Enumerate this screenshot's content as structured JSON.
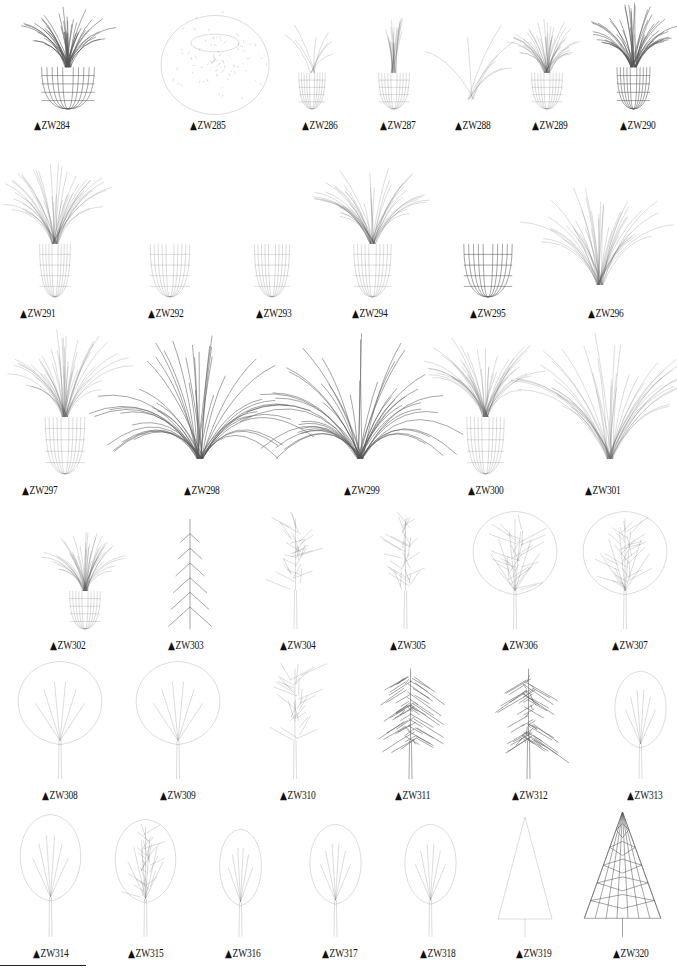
{
  "page": {
    "background": "#ffffff",
    "line_color": "#555555",
    "marker_glyph": "▲"
  },
  "rows": [
    {
      "label_y": 127,
      "items": [
        {
          "code": "ZW284",
          "cx": 68,
          "lx": 34,
          "type": "grass-pot",
          "w": 120,
          "h": 110,
          "dark": true
        },
        {
          "code": "ZW285",
          "cx": 215,
          "lx": 190,
          "type": "round-bush",
          "w": 120,
          "h": 110,
          "dark": false
        },
        {
          "code": "ZW286",
          "cx": 312,
          "lx": 302,
          "type": "leaf-pot",
          "w": 60,
          "h": 95,
          "dark": false
        },
        {
          "code": "ZW287",
          "cx": 394,
          "lx": 380,
          "type": "column-pot",
          "w": 70,
          "h": 95,
          "dark": false
        },
        {
          "code": "ZW288",
          "cx": 471,
          "lx": 455,
          "type": "sprout",
          "w": 40,
          "h": 95,
          "dark": false
        },
        {
          "code": "ZW289",
          "cx": 547,
          "lx": 532,
          "type": "spiky-pot",
          "w": 70,
          "h": 95,
          "dark": false
        },
        {
          "code": "ZW290",
          "cx": 633,
          "lx": 620,
          "type": "palm-globe",
          "w": 75,
          "h": 110,
          "dark": true
        }
      ]
    },
    {
      "label_y": 315,
      "items": [
        {
          "code": "ZW291",
          "cx": 55,
          "lx": 20,
          "type": "grass-pot",
          "w": 70,
          "h": 140,
          "dark": false
        },
        {
          "code": "ZW292",
          "cx": 170,
          "lx": 148,
          "type": "branch-pot",
          "w": 90,
          "h": 140,
          "dark": false
        },
        {
          "code": "ZW293",
          "cx": 272,
          "lx": 256,
          "type": "branch-pot",
          "w": 80,
          "h": 140,
          "dark": false
        },
        {
          "code": "ZW294",
          "cx": 372,
          "lx": 352,
          "type": "spiky-pot",
          "w": 85,
          "h": 140,
          "dark": false
        },
        {
          "code": "ZW295",
          "cx": 488,
          "lx": 470,
          "type": "branch-pot",
          "w": 110,
          "h": 140,
          "dark": true
        },
        {
          "code": "ZW296",
          "cx": 600,
          "lx": 588,
          "type": "grass",
          "w": 100,
          "h": 120,
          "dark": false
        }
      ]
    },
    {
      "label_y": 492,
      "items": [
        {
          "code": "ZW297",
          "cx": 65,
          "lx": 22,
          "type": "spiky-pot",
          "w": 90,
          "h": 150,
          "dark": false
        },
        {
          "code": "ZW298",
          "cx": 200,
          "lx": 184,
          "type": "grass-wide",
          "w": 140,
          "h": 150,
          "dark": true
        },
        {
          "code": "ZW299",
          "cx": 360,
          "lx": 344,
          "type": "grass-wide",
          "w": 140,
          "h": 150,
          "dark": true
        },
        {
          "code": "ZW300",
          "cx": 485,
          "lx": 468,
          "type": "spiky-pot",
          "w": 85,
          "h": 150,
          "dark": false
        },
        {
          "code": "ZW301",
          "cx": 610,
          "lx": 585,
          "type": "grass",
          "w": 100,
          "h": 150,
          "dark": false
        }
      ]
    },
    {
      "label_y": 647,
      "items": [
        {
          "code": "ZW302",
          "cx": 85,
          "lx": 50,
          "type": "v-pot",
          "w": 70,
          "h": 100,
          "dark": false
        },
        {
          "code": "ZW303",
          "cx": 190,
          "lx": 168,
          "type": "conifer",
          "w": 60,
          "h": 110,
          "dark": true
        },
        {
          "code": "ZW304",
          "cx": 295,
          "lx": 280,
          "type": "tree-bare",
          "w": 75,
          "h": 120,
          "dark": false
        },
        {
          "code": "ZW305",
          "cx": 405,
          "lx": 390,
          "type": "tree-bare",
          "w": 75,
          "h": 120,
          "dark": false
        },
        {
          "code": "ZW306",
          "cx": 515,
          "lx": 502,
          "type": "tree-round",
          "w": 90,
          "h": 120,
          "dark": false
        },
        {
          "code": "ZW307",
          "cx": 625,
          "lx": 612,
          "type": "tree-round",
          "w": 90,
          "h": 120,
          "dark": false
        }
      ]
    },
    {
      "label_y": 797,
      "items": [
        {
          "code": "ZW308",
          "cx": 60,
          "lx": 42,
          "type": "tree-oval",
          "w": 90,
          "h": 120,
          "dark": false
        },
        {
          "code": "ZW309",
          "cx": 178,
          "lx": 160,
          "type": "tree-oval",
          "w": 90,
          "h": 120,
          "dark": false
        },
        {
          "code": "ZW310",
          "cx": 295,
          "lx": 280,
          "type": "tree-bare",
          "w": 80,
          "h": 120,
          "dark": false
        },
        {
          "code": "ZW311",
          "cx": 410,
          "lx": 395,
          "type": "tree-weeping",
          "w": 95,
          "h": 120,
          "dark": true
        },
        {
          "code": "ZW312",
          "cx": 528,
          "lx": 512,
          "type": "tree-weeping",
          "w": 95,
          "h": 120,
          "dark": true
        },
        {
          "code": "ZW313",
          "cx": 640,
          "lx": 627,
          "type": "tree-oval",
          "w": 55,
          "h": 110,
          "dark": false
        }
      ]
    },
    {
      "label_y": 955,
      "items": [
        {
          "code": "ZW314",
          "cx": 50,
          "lx": 33,
          "type": "tree-oval",
          "w": 65,
          "h": 125,
          "dark": false
        },
        {
          "code": "ZW315",
          "cx": 145,
          "lx": 128,
          "type": "tree-branched",
          "w": 65,
          "h": 120,
          "dark": false
        },
        {
          "code": "ZW316",
          "cx": 240,
          "lx": 225,
          "type": "tree-oval",
          "w": 45,
          "h": 110,
          "dark": false
        },
        {
          "code": "ZW317",
          "cx": 335,
          "lx": 322,
          "type": "tree-oval",
          "w": 55,
          "h": 115,
          "dark": false
        },
        {
          "code": "ZW318",
          "cx": 430,
          "lx": 420,
          "type": "tree-oval",
          "w": 55,
          "h": 115,
          "dark": false
        },
        {
          "code": "ZW319",
          "cx": 525,
          "lx": 516,
          "type": "cone",
          "w": 60,
          "h": 120,
          "dark": false
        },
        {
          "code": "ZW320",
          "cx": 622,
          "lx": 613,
          "type": "cone-wire",
          "w": 85,
          "h": 125,
          "dark": true
        }
      ]
    }
  ]
}
